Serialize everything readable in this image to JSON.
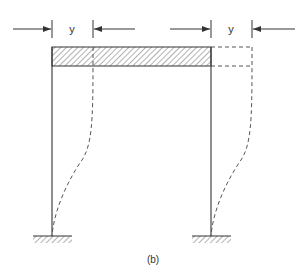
{
  "diagram": {
    "type": "portal-frame-sway",
    "caption": "(b)",
    "dimension_labels": {
      "left": "y",
      "right": "y"
    },
    "colors": {
      "line": "#333333",
      "background": "#ffffff"
    },
    "elements": [
      {
        "id": "beam",
        "kind": "hatched-rigid-beam"
      },
      {
        "id": "left-column",
        "kind": "column"
      },
      {
        "id": "right-column",
        "kind": "column"
      },
      {
        "id": "left-support",
        "kind": "fixed-support"
      },
      {
        "id": "right-support",
        "kind": "fixed-support"
      },
      {
        "id": "deflected-shape",
        "kind": "dashed-displaced-frame"
      },
      {
        "id": "left-dimension",
        "kind": "displacement-arrows",
        "label": "y"
      },
      {
        "id": "right-dimension",
        "kind": "displacement-arrows",
        "label": "y"
      }
    ]
  }
}
